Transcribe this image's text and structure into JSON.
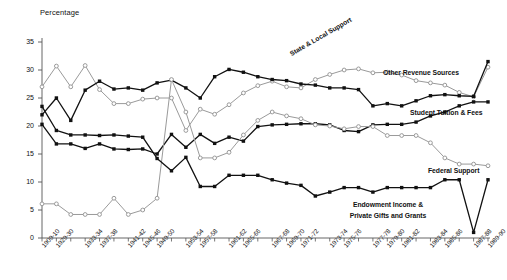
{
  "axis": {
    "y_title": "Percentage",
    "y_ticks": [
      "0",
      "5",
      "10",
      "15",
      "20",
      "25",
      "30",
      "35"
    ],
    "x_ticks": [
      "1909-10",
      "1929-30",
      "1933-34",
      "1937-38",
      "1941-42",
      "1945-46",
      "1949-50",
      "1953-54",
      "1957-58",
      "1961-62",
      "1965-66",
      "1967-68",
      "1969-70",
      "1971-72",
      "1973-74",
      "1975-76",
      "1977-78",
      "1979-80",
      "1981-82",
      "1983-84",
      "1985-86",
      "1987-88",
      "1989-90"
    ]
  },
  "labels": {
    "state_local": "State & Local Support",
    "other_revenue": "Other Revenue Sources",
    "student_tuition": "Student Tuition & Fees",
    "federal_support": "Federal Support",
    "endowment_line1": "Endowment Income &",
    "endowment_line2": "Private Gifts and Grants"
  },
  "colors": {
    "dark": "#111111",
    "mid": "#7a7a7a",
    "open": "#9a9a9a",
    "axis": "#555555",
    "background": "#ffffff"
  },
  "chart_data": {
    "type": "line",
    "title": "",
    "xlabel": "",
    "ylabel": "Percentage",
    "ylim": [
      0,
      35
    ],
    "grid": false,
    "legend": "inline-annotations",
    "categories": [
      "1909-10",
      "1929-30",
      "1931-32",
      "1933-34",
      "1935-36",
      "1937-38",
      "1939-40",
      "1941-42",
      "1943-44",
      "1945-46",
      "1947-48",
      "1949-50",
      "1951-52",
      "1953-54",
      "1955-56",
      "1957-58",
      "1959-60",
      "1961-62",
      "1963-64",
      "1965-66",
      "1967-68",
      "1969-70",
      "1971-72",
      "1973-74",
      "1975-76",
      "1977-78",
      "1979-80",
      "1981-82",
      "1983-84",
      "1985-86",
      "1987-88",
      "1989-90"
    ],
    "series": [
      {
        "name": "State & Local Support",
        "marker": "open-circle",
        "color": "#9a9a9a",
        "values": [
          27.0,
          30.7,
          27.0,
          30.8,
          26.5,
          24.0,
          24.0,
          24.8,
          25.0,
          25.0,
          19.2,
          23.0,
          22.1,
          23.8,
          25.9,
          27.2,
          28.0,
          27.0,
          26.8,
          28.3,
          29.2,
          30.0,
          30.2,
          29.5,
          29.6,
          29.1,
          28.1,
          27.7,
          27.3,
          26.0,
          25.2,
          30.5
        ]
      },
      {
        "name": "Other Revenue Sources",
        "marker": "filled-square",
        "color": "#111111",
        "values": [
          22.0,
          25.0,
          21.0,
          26.4,
          28.0,
          26.6,
          26.8,
          26.4,
          27.7,
          28.2,
          26.8,
          25.0,
          28.8,
          30.1,
          29.6,
          28.8,
          28.3,
          28.1,
          27.5,
          27.3,
          26.8,
          26.8,
          26.5,
          23.6,
          24.0,
          23.6,
          24.5,
          25.4,
          25.6,
          25.4,
          25.3,
          31.5
        ]
      },
      {
        "name": "Student Tuition & Fees",
        "marker": "filled-square",
        "color": "#111111",
        "values": [
          20.3,
          16.8,
          16.8,
          16.0,
          16.8,
          15.9,
          15.8,
          15.9,
          15.0,
          18.5,
          16.2,
          18.5,
          16.9,
          18.0,
          17.3,
          19.9,
          20.2,
          20.3,
          20.4,
          20.4,
          20.2,
          19.2,
          19.0,
          20.2,
          20.3,
          20.3,
          20.7,
          21.8,
          22.5,
          23.6,
          24.3,
          24.3
        ]
      },
      {
        "name": "Federal Support",
        "marker": "open-circle",
        "color": "#9a9a9a",
        "values": [
          6.1,
          6.1,
          4.2,
          4.2,
          4.2,
          7.1,
          4.2,
          5.0,
          7.1,
          28.3,
          22.5,
          14.3,
          14.3,
          15.3,
          18.4,
          21.0,
          22.5,
          21.8,
          21.3,
          20.2,
          20.0,
          19.5,
          19.9,
          19.9,
          18.3,
          18.3,
          18.3,
          17.0,
          14.3,
          13.2,
          13.2,
          12.9
        ]
      },
      {
        "name": "Endowment Income & Private Gifts and Grants",
        "marker": "filled-square",
        "color": "#111111",
        "values": [
          23.5,
          19.2,
          18.4,
          18.4,
          18.3,
          18.4,
          18.2,
          18.0,
          14.2,
          12.0,
          14.4,
          9.2,
          9.2,
          11.2,
          11.2,
          11.2,
          10.4,
          9.8,
          9.4,
          7.5,
          8.2,
          9.0,
          9.0,
          8.2,
          9.0,
          9.0,
          9.0,
          9.0,
          10.4,
          10.4,
          1.0,
          10.4
        ]
      }
    ]
  }
}
